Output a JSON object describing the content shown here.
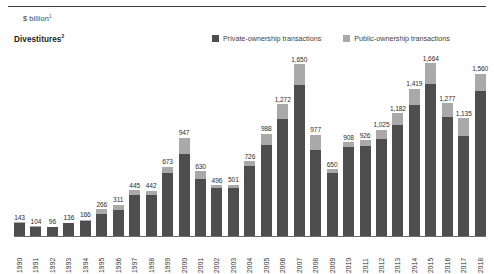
{
  "header": {
    "unit_label": "$ billion",
    "unit_footnote": "1",
    "title": "Divestitures",
    "title_footnote": "2"
  },
  "legend": {
    "position": "top-right",
    "items": [
      {
        "label": "Private-ownership transactions",
        "color": "#4e4e4e",
        "key": "private"
      },
      {
        "label": "Public-ownership transactions",
        "color": "#a9a9a9",
        "key": "public"
      }
    ]
  },
  "colors": {
    "private": "#4e4e4e",
    "public": "#a9a9a9",
    "axis": "#6f6f6f",
    "rule": "#3c3c3c",
    "text": "#231f20"
  },
  "chart_data": {
    "type": "bar",
    "subtype": "stacked-vertical",
    "title": "Divestitures",
    "xlabel": "",
    "ylabel": "$ billion",
    "ylim": [
      0,
      1664
    ],
    "grid": false,
    "legend_position": "top-right",
    "categories": [
      "1990",
      "1991",
      "1992",
      "1993",
      "1994",
      "1995",
      "1996",
      "1997",
      "1998",
      "1999",
      "2000",
      "2001",
      "2002",
      "2003",
      "2004",
      "2005",
      "2006",
      "2007",
      "2008",
      "2009",
      "2010",
      "2011",
      "2012",
      "2013",
      "2014",
      "2015",
      "2016",
      "2017",
      "2018"
    ],
    "totals": [
      143,
      104,
      96,
      136,
      166,
      266,
      311,
      445,
      442,
      673,
      947,
      630,
      496,
      501,
      726,
      988,
      1272,
      1650,
      977,
      650,
      908,
      926,
      1025,
      1182,
      1419,
      1664,
      1277,
      1135,
      1560
    ],
    "total_labels": [
      "143",
      "104",
      "96",
      "136",
      "166",
      "266",
      "311",
      "445",
      "442",
      "673",
      "947",
      "630",
      "496",
      "501",
      "726",
      "988",
      "1,272",
      "1,650",
      "977",
      "650",
      "908",
      "926",
      "1,025",
      "1,182",
      "1,419",
      "1,664",
      "1,277",
      "1,135",
      "1,560"
    ],
    "series": [
      {
        "name": "Private-ownership transactions",
        "color": "#4e4e4e",
        "values": [
          138,
          100,
          92,
          130,
          150,
          222,
          258,
          404,
          400,
          608,
          790,
          556,
          470,
          472,
          676,
          884,
          1128,
          1452,
          830,
          614,
          862,
          868,
          934,
          1074,
          1262,
          1468,
          1148,
          966,
          1398
        ]
      },
      {
        "name": "Public-ownership transactions",
        "color": "#a9a9a9",
        "values": [
          5,
          4,
          4,
          6,
          16,
          44,
          53,
          41,
          42,
          65,
          157,
          74,
          26,
          29,
          50,
          104,
          144,
          198,
          147,
          36,
          46,
          58,
          91,
          108,
          157,
          196,
          129,
          169,
          162
        ]
      }
    ]
  }
}
